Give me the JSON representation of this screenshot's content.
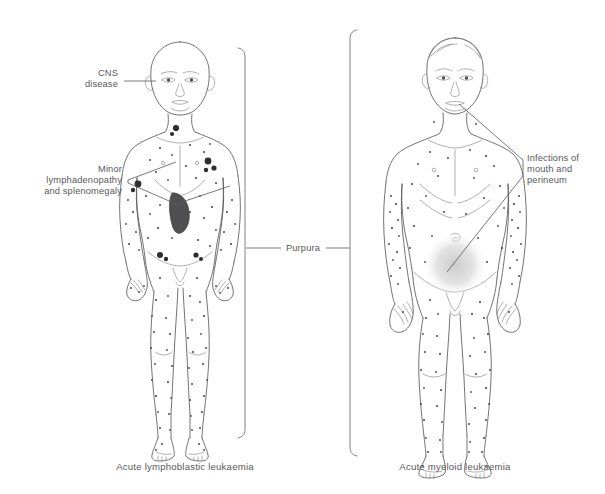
{
  "diagram": {
    "title_visible": false,
    "background_color": "#ffffff",
    "line_color": "#5a5a5c",
    "text_color": "#58585a",
    "marker_color": "#4b4b4d",
    "node_color": "#2e2e30",
    "spleen_color": "#4f4f51",
    "shading_color": "#d9d9d9"
  },
  "annotations": {
    "cns": {
      "lines": [
        "CNS",
        "disease"
      ],
      "align": "right",
      "x": 118,
      "y": 76
    },
    "lymph": {
      "lines": [
        "Minor",
        "lymphadenopathy",
        "and splenomegaly"
      ],
      "align": "right",
      "x": 122,
      "y": 172
    },
    "purpura": {
      "lines": [
        "Purpura"
      ],
      "align": "center",
      "x": 298,
      "y": 248
    },
    "infections": {
      "lines": [
        "Infections of",
        "mouth and",
        "perineum"
      ],
      "align": "left",
      "x": 527,
      "y": 161
    }
  },
  "captions": {
    "left": "Acute lymphoblastic leukaemia",
    "right": "Acute myeloid leukaemia"
  },
  "figures": {
    "left": {
      "label": "child-figure-all",
      "description": "bald child, anterior view"
    },
    "right": {
      "label": "adult-figure-aml",
      "description": "adult with hair, anterior view"
    }
  },
  "footer": {
    "text": ""
  }
}
